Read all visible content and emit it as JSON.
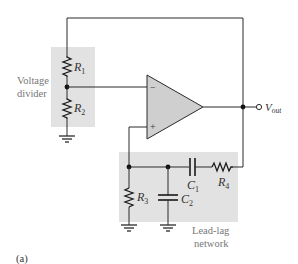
{
  "figure": {
    "caption": "(a)",
    "type": "Wien-bridge oscillator circuit"
  },
  "colors": {
    "box_fill": "#e2e2e2",
    "opamp_fill": "#cfcfcf",
    "wire": "#2a2a2a",
    "label_gray": "#777777"
  },
  "blocks": {
    "voltage_divider": {
      "line1": "Voltage",
      "line2": "divider"
    },
    "lead_lag": {
      "line1": "Lead-lag",
      "line2": "network"
    }
  },
  "components": {
    "R1": {
      "letter": "R",
      "sub": "1"
    },
    "R2": {
      "letter": "R",
      "sub": "2"
    },
    "R3": {
      "letter": "R",
      "sub": "3"
    },
    "R4": {
      "letter": "R",
      "sub": "4"
    },
    "C1": {
      "letter": "C",
      "sub": "1"
    },
    "C2": {
      "letter": "C",
      "sub": "2"
    }
  },
  "opamp": {
    "minus": "−",
    "plus": "+"
  },
  "output": {
    "letter": "V",
    "sub": "out"
  }
}
